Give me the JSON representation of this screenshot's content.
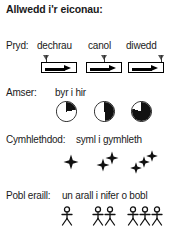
{
  "panel": {
    "title": "Allwedd i'r eiconau:",
    "background_color": "#ffffff",
    "ink_color": "#1a1a1a"
  },
  "rows": [
    {
      "key": "when",
      "label": "Pryd:",
      "terms": [
        "dechrau",
        "canol",
        "diwedd"
      ],
      "icon_name": "arrow-box-icon",
      "marker_positions": [
        "left",
        "middle",
        "right"
      ]
    },
    {
      "key": "duration",
      "label": "Amser:",
      "caption": "byr i hir",
      "icon_name": "pie-clock-icon",
      "pie_fractions": [
        0.22,
        0.5,
        0.8
      ]
    },
    {
      "key": "complexity",
      "label": "Cymhlethdod:",
      "caption": "syml i gymhleth",
      "icon_name": "star-sparkle-icon",
      "star_counts": [
        1,
        2,
        3
      ]
    },
    {
      "key": "people",
      "label": "Pobl eraill:",
      "caption": "un arall i nifer o bobl",
      "icon_name": "stick-figure-icon",
      "figure_counts": [
        1,
        2,
        3
      ]
    }
  ]
}
